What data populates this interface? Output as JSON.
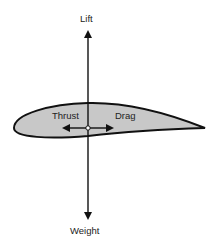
{
  "diagram": {
    "labels": {
      "lift": "Lift",
      "weight": "Weight",
      "thrust": "Thrust",
      "drag": "Drag"
    },
    "colors": {
      "airfoil_fill": "#c8c8c8",
      "stroke": "#111111",
      "background": "#ffffff"
    }
  }
}
